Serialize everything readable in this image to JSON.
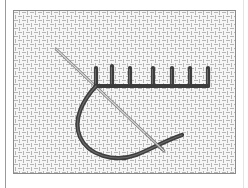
{
  "figure": {
    "stitch_count": 7,
    "colors": {
      "fabric_background": "#f4f4f4",
      "fabric_weave": "#9a9a9a",
      "thread": "#4a4a4a",
      "needle": "#b8b8b8",
      "border": "#8a8a8a"
    }
  }
}
